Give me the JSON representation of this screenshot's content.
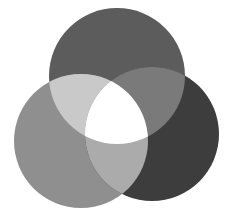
{
  "diagram": {
    "type": "venn-3",
    "background": "#ffffff",
    "circles": [
      {
        "id": "top",
        "cx": 117,
        "cy": 76,
        "r": 68,
        "color": "#5c5c5c"
      },
      {
        "id": "left",
        "cx": 81,
        "cy": 141,
        "r": 67,
        "color": "#8f8f8f"
      },
      {
        "id": "right",
        "cx": 152,
        "cy": 134,
        "r": 67,
        "color": "#3d3d3d"
      }
    ],
    "intersections": {
      "top_left": "#c9c9c9",
      "top_right": "#7a7a7a",
      "left_right": "#ababab",
      "all": "#ffffff"
    }
  }
}
